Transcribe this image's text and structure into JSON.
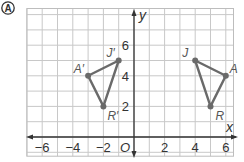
{
  "problem_label": "A",
  "axes": {
    "x_label": "x",
    "y_label": "y",
    "origin_label": "O",
    "x_ticks": [
      {
        "value": -6,
        "label": "−6"
      },
      {
        "value": -4,
        "label": "−4"
      },
      {
        "value": -2,
        "label": "−2"
      },
      {
        "value": 2,
        "label": "2"
      },
      {
        "value": 4,
        "label": "4"
      },
      {
        "value": 6,
        "label": "6"
      }
    ],
    "y_ticks": [
      {
        "value": 2,
        "label": "2"
      },
      {
        "value": 4,
        "label": "4"
      },
      {
        "value": 6,
        "label": "6"
      }
    ],
    "x_range": [
      -7,
      6.5
    ],
    "y_range": [
      -1.25,
      8.4
    ]
  },
  "triangles": [
    {
      "name": "JAR",
      "vertices": [
        {
          "label": "J",
          "x": 4,
          "y": 5
        },
        {
          "label": "A",
          "x": 6,
          "y": 4
        },
        {
          "label": "R",
          "x": 5,
          "y": 2
        }
      ]
    },
    {
      "name": "J'A'R'",
      "vertices": [
        {
          "label": "J′",
          "x": -1,
          "y": 5
        },
        {
          "label": "A′",
          "x": -3,
          "y": 4
        },
        {
          "label": "R′",
          "x": -2,
          "y": 2
        }
      ]
    }
  ],
  "colors": {
    "grid": "#c8c8c8",
    "axis": "#333333",
    "triangle": "#6a6a6a",
    "label": "#555555"
  }
}
